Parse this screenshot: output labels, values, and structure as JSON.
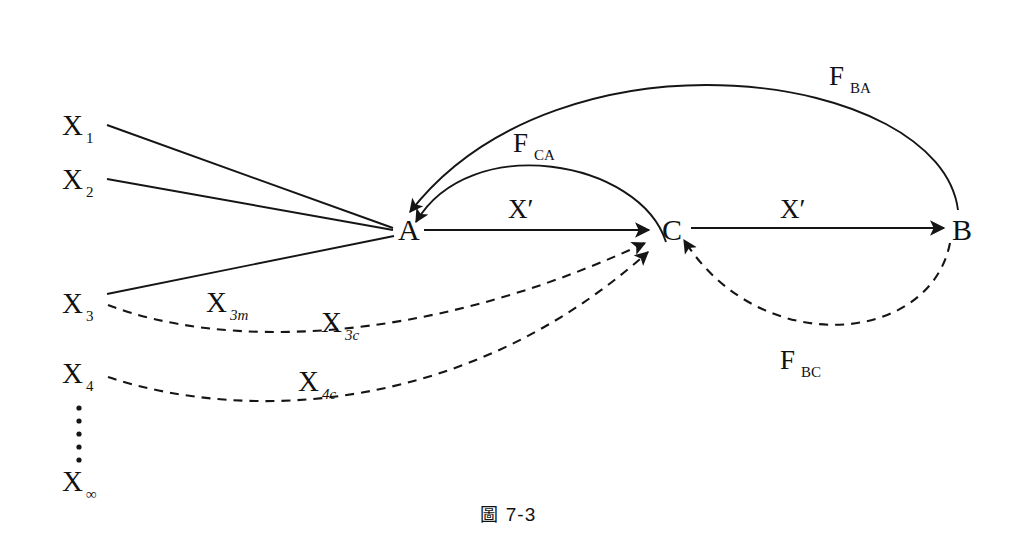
{
  "figure": {
    "caption_symbol": "圖",
    "caption_number": "7-3",
    "background": "#ffffff",
    "ink_color": "#151515"
  },
  "nodes": [
    {
      "id": "A",
      "label": "A",
      "x": 408,
      "y": 228
    },
    {
      "id": "C",
      "label": "C",
      "x": 672,
      "y": 228
    },
    {
      "id": "B",
      "label": "B",
      "x": 962,
      "y": 228
    }
  ],
  "variables": [
    {
      "id": "X1",
      "base": "X",
      "sub": "1",
      "sub_italic": false,
      "x": 66,
      "y": 128
    },
    {
      "id": "X2",
      "base": "X",
      "sub": "2",
      "sub_italic": false,
      "x": 66,
      "y": 184
    },
    {
      "id": "X3",
      "base": "X",
      "sub": "3",
      "sub_italic": false,
      "x": 66,
      "y": 308
    },
    {
      "id": "X4",
      "base": "X",
      "sub": "4",
      "sub_italic": false,
      "x": 66,
      "y": 378
    },
    {
      "id": "Xn",
      "base": "X",
      "sub": "∞",
      "sub_italic": true,
      "x": 66,
      "y": 486
    }
  ],
  "edge_labels": [
    {
      "id": "X3m",
      "base": "X",
      "sub": "3m",
      "sub_italic": true,
      "x": 210,
      "y": 307,
      "kind": "variable"
    },
    {
      "id": "X3c",
      "base": "X",
      "sub": "3c",
      "sub_italic": true,
      "x": 325,
      "y": 327,
      "kind": "variable"
    },
    {
      "id": "X4c",
      "base": "X",
      "sub": "4c",
      "sub_italic": true,
      "x": 302,
      "y": 386,
      "kind": "variable"
    },
    {
      "id": "Xprime_AC",
      "base": "X′",
      "sub": "",
      "sub_italic": false,
      "x": 521,
      "y": 212,
      "kind": "prime"
    },
    {
      "id": "Xprime_CB",
      "base": "X′",
      "sub": "",
      "sub_italic": false,
      "x": 793,
      "y": 212,
      "kind": "prime"
    },
    {
      "id": "FCA",
      "base": "F",
      "sub": "CA",
      "sub_italic": false,
      "x": 517,
      "y": 145,
      "kind": "feedback"
    },
    {
      "id": "FBA",
      "base": "F",
      "sub": "BA",
      "sub_italic": false,
      "x": 833,
      "y": 78,
      "kind": "feedback"
    },
    {
      "id": "FBC",
      "base": "F",
      "sub": "BC",
      "sub_italic": false,
      "x": 784,
      "y": 362,
      "kind": "feedback"
    }
  ],
  "edges": [
    {
      "id": "X1-A",
      "from": "X1",
      "to": "A",
      "style": "solid",
      "arrow": false,
      "label": ""
    },
    {
      "id": "X2-A",
      "from": "X2",
      "to": "A",
      "style": "solid",
      "arrow": false,
      "label": ""
    },
    {
      "id": "X3-A",
      "from": "X3",
      "to": "A",
      "style": "solid",
      "arrow": false,
      "label": "X3m"
    },
    {
      "id": "X3-C",
      "from": "X3",
      "to": "C",
      "style": "dashed",
      "arrow": true,
      "label": "X3c"
    },
    {
      "id": "X4-C",
      "from": "X4",
      "to": "C",
      "style": "dashed",
      "arrow": true,
      "label": "X4c"
    },
    {
      "id": "A-C",
      "from": "A",
      "to": "C",
      "style": "solid",
      "arrow": true,
      "label": "Xprime_AC"
    },
    {
      "id": "C-B",
      "from": "C",
      "to": "B",
      "style": "solid",
      "arrow": true,
      "label": "Xprime_CB"
    },
    {
      "id": "C-A",
      "from": "C",
      "to": "A",
      "style": "solid",
      "arrow": true,
      "label": "FCA"
    },
    {
      "id": "B-A",
      "from": "B",
      "to": "A",
      "style": "solid",
      "arrow": true,
      "label": "FBA"
    },
    {
      "id": "B-C",
      "from": "B",
      "to": "C",
      "style": "dashed",
      "arrow": true,
      "label": "FBC"
    }
  ],
  "vertical_dots": {
    "id": "ellipsis",
    "count": 6,
    "x": 79,
    "y_start": 408,
    "y_step": 13
  }
}
